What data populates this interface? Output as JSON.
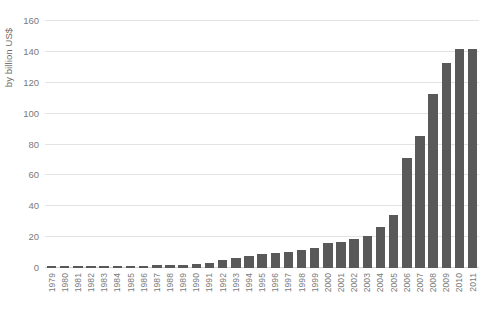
{
  "chart_data": {
    "type": "bar",
    "title": "",
    "subtitle": "",
    "xlabel": "",
    "ylabel": "by billion US$",
    "ylim": [
      0,
      160
    ],
    "yticks": [
      0,
      20,
      40,
      60,
      80,
      100,
      120,
      140,
      160
    ],
    "ytick_labels": [
      "0",
      "20",
      "40",
      "60",
      "80",
      "100",
      "120",
      "140",
      "160"
    ],
    "grid": true,
    "legend": false,
    "legend_position": "none",
    "bar_color": "#595959",
    "gridline_color": "#e3e3e3",
    "axis_text_color": "#7a7a7a",
    "categories": [
      "1979",
      "1980",
      "1981",
      "1982",
      "1983",
      "1984",
      "1985",
      "1986",
      "1987",
      "1988",
      "1989",
      "1990",
      "1991",
      "1992",
      "1993",
      "1994",
      "1995",
      "1996",
      "1997",
      "1998",
      "1999",
      "2000",
      "2001",
      "2002",
      "2003",
      "2004",
      "2005",
      "2006",
      "2007",
      "2008",
      "2009",
      "2010",
      "2011"
    ],
    "values": [
      1.0,
      1.0,
      1.0,
      1.0,
      1.2,
      1.5,
      1.5,
      1.6,
      1.8,
      2.0,
      2.2,
      2.6,
      3.5,
      5.5,
      6.5,
      8.0,
      9.0,
      9.5,
      10.5,
      11.5,
      13.0,
      16.0,
      17.0,
      19.0,
      21.0,
      26.5,
      34.5,
      71.0,
      85.5,
      113.0,
      133.0,
      142.0,
      142.0
    ]
  }
}
